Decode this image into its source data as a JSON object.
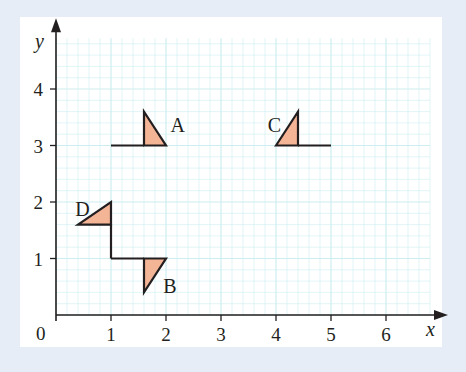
{
  "diagram": {
    "type": "coordinate-grid-transformations",
    "axes": {
      "x_label": "x",
      "y_label": "y",
      "origin_label": "0",
      "x_ticks": [
        "1",
        "2",
        "3",
        "4",
        "5",
        "6"
      ],
      "y_ticks": [
        "1",
        "2",
        "3",
        "4"
      ],
      "x_range": [
        0,
        6.8
      ],
      "y_range": [
        0,
        4.9
      ]
    },
    "grid": {
      "minor_step": 0.2,
      "major_step": 1,
      "color": "#cdeef0"
    },
    "colors": {
      "fill": "#f4b496",
      "stroke": "#231f20",
      "background": "#e6edf6",
      "panel": "#ffffff"
    },
    "shapes": [
      {
        "label": "A",
        "line": [
          [
            1,
            3
          ],
          [
            1.6,
            3
          ]
        ],
        "triangle": [
          [
            1.6,
            3
          ],
          [
            1.6,
            3.6
          ],
          [
            2,
            3
          ]
        ],
        "label_pos": [
          2.08,
          3.35
        ]
      },
      {
        "label": "B",
        "line": [
          [
            1,
            1
          ],
          [
            1.6,
            1
          ]
        ],
        "triangle": [
          [
            1.6,
            1
          ],
          [
            2,
            1
          ],
          [
            1.6,
            0.4
          ]
        ],
        "label_pos": [
          1.95,
          0.5
        ]
      },
      {
        "label": "C",
        "line": [
          [
            4.4,
            3
          ],
          [
            5,
            3
          ]
        ],
        "triangle": [
          [
            4,
            3
          ],
          [
            4.4,
            3.6
          ],
          [
            4.4,
            3
          ]
        ],
        "label_pos": [
          3.85,
          3.35
        ]
      },
      {
        "label": "D",
        "line": [
          [
            1,
            1
          ],
          [
            1,
            1.6
          ]
        ],
        "triangle": [
          [
            1,
            1.6
          ],
          [
            1,
            2
          ],
          [
            0.4,
            1.6
          ]
        ],
        "label_pos": [
          0.35,
          1.85
        ]
      }
    ]
  }
}
